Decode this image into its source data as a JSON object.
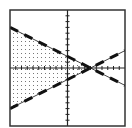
{
  "chart_data": {
    "type": "line",
    "title": "",
    "xlabel": "",
    "ylabel": "",
    "xlim": [
      -10,
      10
    ],
    "ylim": [
      -10,
      10
    ],
    "xtick_step": 1,
    "ytick_step": 1,
    "grid": false,
    "legend": null,
    "series": [
      {
        "name": "boundary-1",
        "equation": "y = -0.5x + 2",
        "slope": -0.5,
        "intercept": 2,
        "style": "dashed",
        "x": [
          -10,
          10
        ],
        "y": [
          7,
          -3
        ]
      },
      {
        "name": "boundary-2",
        "equation": "y = 0.5x - 2",
        "slope": 0.5,
        "intercept": -2,
        "style": "dashed",
        "x": [
          -10,
          10
        ],
        "y": [
          -7,
          3
        ]
      }
    ],
    "shaded_region": {
      "description": "y < -0.5x + 2 and y > 0.5x - 2",
      "pattern": "dots",
      "vertices": [
        [
          -10,
          7
        ],
        [
          4,
          0
        ],
        [
          -10,
          -7
        ]
      ]
    },
    "intersection": [
      4,
      0
    ]
  },
  "colors": {
    "line": "#111111",
    "frame": "#333333",
    "axis": "#222222",
    "dots": "#777777",
    "background": "#ffffff"
  }
}
